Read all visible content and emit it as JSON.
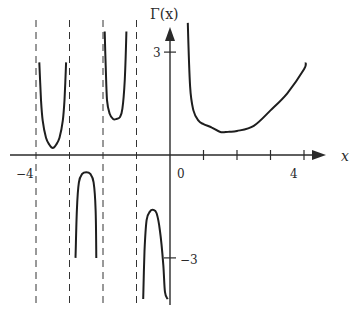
{
  "chart_data": {
    "type": "line",
    "title": "",
    "xlabel": "x",
    "ylabel": "Γ(x)",
    "x_tick_labels": [
      "-4",
      "0",
      "4"
    ],
    "y_tick_labels": [
      "3",
      "-3"
    ],
    "x_ticks": [
      -4,
      -3,
      -2,
      -1,
      1,
      2,
      3,
      4
    ],
    "y_ticks": [
      3,
      -3
    ],
    "xlim": [
      -4.9,
      4.6
    ],
    "ylim": [
      -4.3,
      3.9
    ],
    "grid": false,
    "legend": null,
    "asymptotes": [
      -4,
      -3,
      -2,
      -1,
      0
    ],
    "series": [
      {
        "name": "Gamma (-4,-3)",
        "x": [
          -3.9,
          -3.85,
          -3.8,
          -3.7,
          -3.6,
          -3.5,
          -3.4,
          -3.3,
          -3.2,
          -3.15,
          -3.1
        ],
        "y": [
          2.7,
          1.6,
          1.0,
          0.5,
          0.3,
          0.2,
          0.3,
          0.5,
          1.0,
          1.6,
          2.7
        ]
      },
      {
        "name": "Gamma (-3,-2)",
        "x": [
          -2.82,
          -2.78,
          -2.72,
          -2.62,
          -2.5,
          -2.38,
          -2.28,
          -2.22,
          -2.2
        ],
        "y": [
          -3.0,
          -1.6,
          -0.8,
          -0.55,
          -0.5,
          -0.55,
          -0.8,
          -1.6,
          -3.0
        ]
      },
      {
        "name": "Gamma (-2,-1)",
        "x": [
          -1.95,
          -1.92,
          -1.88,
          -1.8,
          -1.7,
          -1.6,
          -1.5,
          -1.42,
          -1.35,
          -1.3
        ],
        "y": [
          3.6,
          2.6,
          1.6,
          1.2,
          1.05,
          1.05,
          1.1,
          1.35,
          2.2,
          3.6
        ]
      },
      {
        "name": "Gamma (-1,0)",
        "x": [
          -0.8,
          -0.76,
          -0.7,
          -0.6,
          -0.5,
          -0.4,
          -0.3,
          -0.2,
          -0.15,
          -0.07
        ],
        "y": [
          -4.2,
          -2.8,
          -1.9,
          -1.65,
          -1.6,
          -1.7,
          -2.2,
          -3.2,
          -4.0,
          -4.2
        ]
      },
      {
        "name": "Gamma (0,+inf)",
        "x": [
          0.53,
          0.6,
          0.7,
          0.85,
          1.0,
          1.25,
          1.5,
          1.75,
          2.0,
          2.5,
          3.0,
          3.5,
          4.0,
          4.05
        ],
        "y": [
          3.85,
          2.0,
          1.3,
          1.0,
          0.9,
          0.8,
          0.67,
          0.68,
          0.7,
          0.85,
          1.3,
          1.8,
          2.5,
          2.7
        ]
      }
    ]
  },
  "labels": {
    "y_axis": "Γ(x)",
    "x_axis": "x",
    "x_minus4": "−4",
    "x_zero": "0",
    "x_four": "4",
    "y_three": "3",
    "y_minus3": "−3"
  }
}
